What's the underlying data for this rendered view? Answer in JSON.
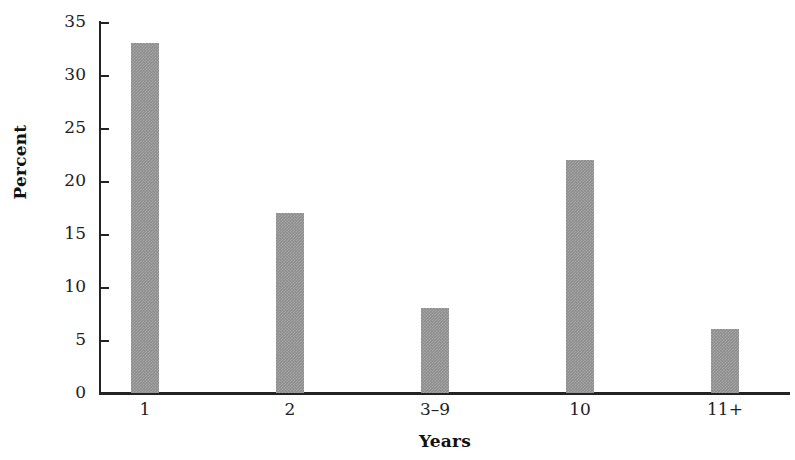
{
  "chart_data": {
    "type": "bar",
    "title": "",
    "subtitle": "",
    "xlabel": "Years",
    "ylabel": "Percent",
    "categories": [
      "1",
      "2",
      "3–9",
      "10",
      "11+"
    ],
    "values": [
      33,
      17,
      8,
      22,
      6
    ],
    "series": [
      {
        "name": "Percent",
        "values": [
          33,
          17,
          8,
          22,
          6
        ]
      }
    ],
    "ylim": [
      0,
      35
    ],
    "yticks": [
      0,
      5,
      10,
      15,
      20,
      25,
      30,
      35
    ],
    "ytick_labels": [
      "0",
      "5",
      "10",
      "15",
      "20",
      "25",
      "30",
      "35"
    ],
    "grid": false,
    "legend": false,
    "legend_position": "none",
    "bar_color": "#8d8d8d",
    "axis_color": "#232323",
    "background_color": "#ffffff",
    "annotations": []
  }
}
